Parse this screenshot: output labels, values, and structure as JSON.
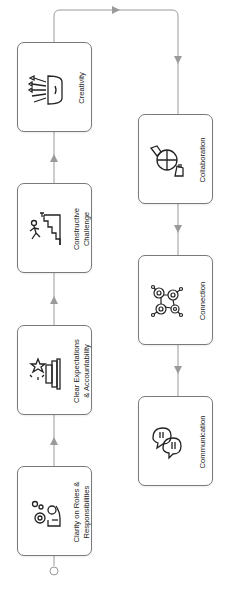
{
  "diagram": {
    "orientation": "rotated-90-ccw",
    "line_color": "#9a9a9a",
    "box_border_color": "#7a7a7a",
    "nodes": [
      {
        "id": "clarity",
        "label_line1": "Clarity on Roles &",
        "label_line2": "Responsibilities",
        "icon": "gear-hand-icon"
      },
      {
        "id": "expectations",
        "label_line1": "Clear Expectations",
        "label_line2": "& Accountability",
        "icon": "star-podium-icon"
      },
      {
        "id": "challenge",
        "label_line1": "Constructive",
        "label_line2": "Challenge",
        "icon": "climber-stairs-icon"
      },
      {
        "id": "creativity",
        "label_line1": "Creativity",
        "label_line2": "",
        "icon": "crayons-cup-icon"
      },
      {
        "id": "collaboration",
        "label_line1": "Collaboration",
        "label_line2": "",
        "icon": "puzzle-hands-icon"
      },
      {
        "id": "connection",
        "label_line1": "Connection",
        "label_line2": "",
        "icon": "network-nodes-icon"
      },
      {
        "id": "communication",
        "label_line1": "Communication",
        "label_line2": "",
        "icon": "speech-bubbles-icon"
      }
    ],
    "edges": [
      {
        "from": "start",
        "to": "clarity"
      },
      {
        "from": "clarity",
        "to": "expectations"
      },
      {
        "from": "expectations",
        "to": "challenge"
      },
      {
        "from": "challenge",
        "to": "creativity"
      },
      {
        "from": "creativity",
        "to": "collaboration"
      },
      {
        "from": "collaboration",
        "to": "connection"
      },
      {
        "from": "connection",
        "to": "communication"
      }
    ]
  }
}
